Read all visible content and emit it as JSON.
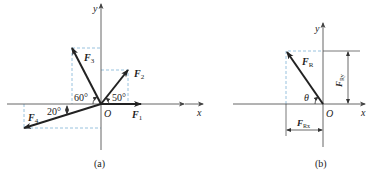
{
  "figure_a": {
    "caption": "(a)",
    "axis_x": "x",
    "axis_y": "y",
    "origin": "O",
    "forces": [
      {
        "name": "F",
        "sub": "1",
        "angle_label": ""
      },
      {
        "name": "F",
        "sub": "2",
        "angle_label": "50°"
      },
      {
        "name": "F",
        "sub": "3",
        "angle_label": "60°"
      },
      {
        "name": "F",
        "sub": "4",
        "angle_label": "20°"
      }
    ]
  },
  "figure_b": {
    "caption": "(b)",
    "axis_x": "x",
    "axis_y": "y",
    "origin": "O",
    "resultant": {
      "name": "F",
      "sub": "R"
    },
    "angle": "θ",
    "component_x": {
      "name": "F",
      "sub": "Rx"
    },
    "component_y": {
      "name": "F",
      "sub": "Ry"
    }
  },
  "colors": {
    "line": "#222222",
    "axis": "#555555",
    "dashed": "#7fb3d5"
  }
}
